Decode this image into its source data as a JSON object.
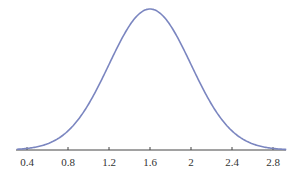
{
  "chart_data": {
    "type": "line",
    "title": "",
    "xlabel": "",
    "ylabel": "",
    "distribution": {
      "mean": 1.6,
      "std": 0.4
    },
    "xlim": [
      0.3,
      2.93
    ],
    "x_ticks": [
      0.4,
      0.8,
      1.2,
      1.6,
      2,
      2.4,
      2.8
    ],
    "x_tick_labels": [
      "0.4",
      "0.8",
      "1.2",
      "1.6",
      "2",
      "2.4",
      "2.8"
    ],
    "grid": false,
    "legend": null,
    "series": [
      {
        "name": "density",
        "color": "#7b86c0",
        "x": [
          0.4,
          0.6,
          0.8,
          1.0,
          1.2,
          1.4,
          1.6,
          1.8,
          2.0,
          2.2,
          2.4,
          2.6,
          2.8
        ],
        "y": [
          0.011,
          0.044,
          0.135,
          0.324,
          0.605,
          0.88,
          0.997,
          0.88,
          0.605,
          0.324,
          0.135,
          0.044,
          0.011
        ]
      }
    ]
  },
  "colors": {
    "curve": "#7b86c0",
    "axis": "#444444"
  }
}
